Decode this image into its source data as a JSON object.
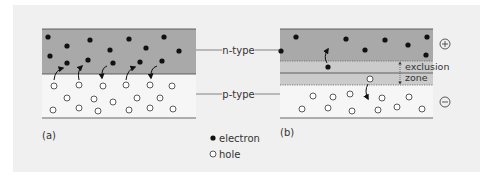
{
  "diagram": {
    "colors": {
      "background": "#f0f0f0",
      "n_region": "#a9a9a9",
      "p_region": "#f4f4f4",
      "exclusion_zone": "#c8c8c8",
      "electron": "#111111",
      "hole_fill": "#ffffff",
      "line": "#444444"
    },
    "labels": {
      "n_type": "n-type",
      "p_type": "p-type",
      "exclusion_zone_line1": "exclusion",
      "exclusion_zone_line2": "zone",
      "panel_a": "(a)",
      "panel_b": "(b)",
      "plus": "+",
      "minus": "−"
    },
    "legend": {
      "items": [
        {
          "symbol": "filled-circle",
          "label": "electron"
        },
        {
          "symbol": "open-circle",
          "label": "hole"
        }
      ]
    },
    "panel_a": {
      "description": "n-type layer above p-type layer; electrons and holes diffuse across the junction (curved arrows)",
      "arrow_count": 5
    },
    "panel_b": {
      "description": "junction with exclusion zone between n-type and p-type; + terminal on n side, − terminal on p side",
      "arrow_count": 2
    }
  }
}
